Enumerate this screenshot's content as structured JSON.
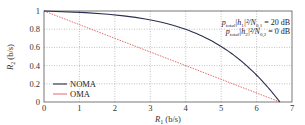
{
  "chart_data": {
    "type": "line",
    "title": "",
    "xlabel": "R_1 (b/s)",
    "ylabel": "R_2 (b/s)",
    "xlim": [
      0,
      7
    ],
    "ylim": [
      0,
      1
    ],
    "xticks": [
      "0",
      "1",
      "2",
      "3",
      "4",
      "5",
      "6",
      "7"
    ],
    "yticks": [
      "0",
      "0.2",
      "0.4",
      "0.6",
      "0.8",
      "1"
    ],
    "grid": true,
    "legend_position": "lower left",
    "annotations": [
      "p_total|h_1|^2/N_0,1 = 20 dB",
      "p_total|h_2|^2/N_0,2 = 0 dB"
    ],
    "series": [
      {
        "name": "NOMA",
        "color": "#2b2f4f",
        "style": "solid",
        "x": [
          0,
          1.0,
          2.0,
          3.0,
          4.0,
          4.5,
          5.0,
          5.5,
          6.0,
          6.3,
          6.5,
          6.66
        ],
        "y": [
          1.0,
          0.986,
          0.958,
          0.902,
          0.798,
          0.72,
          0.61,
          0.47,
          0.295,
          0.178,
          0.09,
          0.0
        ]
      },
      {
        "name": "OMA",
        "color": "#e05a5a",
        "style": "dotted",
        "x": [
          0,
          6.66
        ],
        "y": [
          1.0,
          0.0
        ]
      }
    ]
  },
  "labels": {
    "x_axis": "R",
    "x_axis_sub": "1",
    "x_axis_unit": " (b/s)",
    "y_axis": "R",
    "y_axis_sub": "2",
    "y_axis_unit": " (b/s)",
    "legend_noma": "NOMA",
    "legend_oma": "OMA",
    "annot1_a": "p",
    "annot1_sub": "total",
    "annot1_b": "|h",
    "annot1_c": "1",
    "annot1_d": "|²/N",
    "annot1_e": "0,1",
    "annot1_f": " = 20 dB",
    "annot2_a": "p",
    "annot2_sub": "total",
    "annot2_b": "|h",
    "annot2_c": "2",
    "annot2_d": "|²/N",
    "annot2_e": "0,2",
    "annot2_f": " = 0 dB"
  }
}
